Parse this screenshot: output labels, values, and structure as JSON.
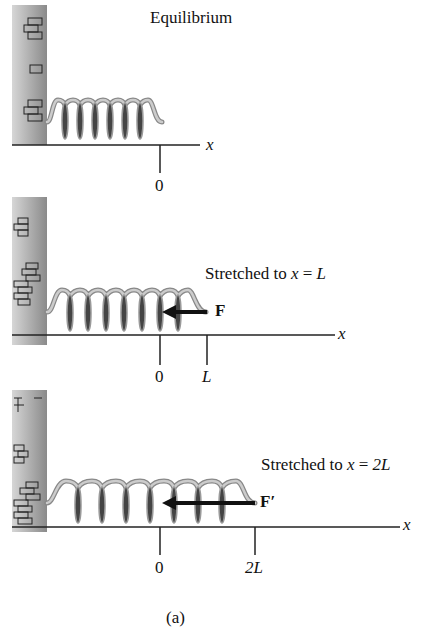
{
  "panels": [
    {
      "title": "Equilibrium",
      "tick_labels": [
        "0"
      ],
      "axis_label": "x"
    },
    {
      "title_prefix": "Stretched to ",
      "title_var": "x",
      "title_eq": " = ",
      "title_val": "L",
      "force_label": "F",
      "tick_labels": [
        "0",
        "L"
      ],
      "axis_label": "x"
    },
    {
      "title_prefix": "Stretched to ",
      "title_var": "x",
      "title_eq": " = ",
      "title_val": "2L",
      "force_label": "F′",
      "tick_labels": [
        "0",
        "2L"
      ],
      "axis_label": "x"
    }
  ],
  "caption": "(a)",
  "colors": {
    "wall": "#9a9a9a",
    "spring": "#b0b0b0",
    "spring_dark": "#3a3a3a",
    "line": "#222222"
  }
}
